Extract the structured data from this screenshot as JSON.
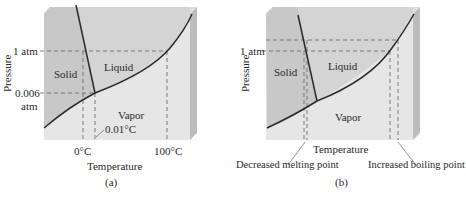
{
  "figure": {
    "panel_a": {
      "caption": "(a)",
      "y_axis_label": "Pressure",
      "x_axis_label": "Temperature",
      "pressure_ticks": [
        "1 atm",
        "0.006",
        "atm"
      ],
      "temperature_ticks": [
        "0°C",
        "100°C"
      ],
      "triple_point_label": "0.01°C",
      "regions": [
        "Solid",
        "Liquid",
        "Vapor"
      ]
    },
    "panel_b": {
      "caption": "(b)",
      "y_axis_label": "Pressure",
      "x_axis_label": "Temperature",
      "pressure_ticks": [
        "1 atm"
      ],
      "regions": [
        "Solid",
        "Liquid",
        "Vapor"
      ],
      "annotations": [
        "Decreased melting point",
        "Increased boiling point"
      ]
    },
    "colors": {
      "solid_region": "#c9c9c9",
      "liquid_region": "#d3d3d3",
      "vapor_region": "#e6e6e6",
      "side_face": "#bdbdbd",
      "top_face": "#dcdcdc",
      "curve": "#2a2a2a",
      "dashed": "#6a6a6a"
    }
  }
}
